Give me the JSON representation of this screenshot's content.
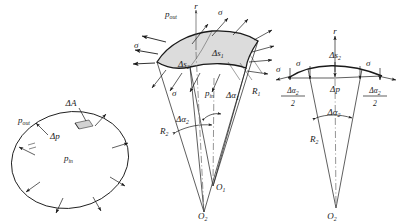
{
  "figure": {
    "background": "#ffffff",
    "ink": "#1a1a1a",
    "patch_fill": "#dcdcdc"
  },
  "fig_left": {
    "name": "closed-surface-pressure",
    "labels": {
      "delta_area": "ΔA",
      "delta_p": "Δp",
      "p_out": "p",
      "p_out_sub": "out",
      "p_in": "p",
      "p_in_sub": "in"
    },
    "arrow_count": 8
  },
  "fig_middle": {
    "name": "shell-element-3d",
    "labels": {
      "radial_axis": "r",
      "p_out": "p",
      "p_out_sub": "out",
      "p_in": "p",
      "p_in_sub": "in",
      "sigma": "σ",
      "delta_s1": "Δs",
      "delta_s1_sub": "1",
      "delta_s2": "Δs",
      "delta_s2_sub": "2",
      "delta_alpha1": "Δα",
      "delta_alpha1_sub": "1",
      "delta_alpha2": "Δα",
      "delta_alpha2_sub": "2",
      "radius_1": "R",
      "radius_1_sub": "1",
      "radius_2": "R",
      "radius_2_sub": "2",
      "center_1": "O",
      "center_1_sub": "1",
      "center_2": "O",
      "center_2_sub": "2"
    },
    "sigma_label_count": 4
  },
  "fig_right": {
    "name": "shell-element-section",
    "labels": {
      "radial_axis": "r",
      "sigma": "σ",
      "delta_s2": "Δs",
      "delta_s2_sub": "2",
      "delta_p": "Δp",
      "half_angle_num": "Δα",
      "half_angle_num_sub": "2",
      "half_angle_den": "2",
      "delta_alpha2": "Δα",
      "delta_alpha2_sub": "2",
      "radius_2": "R",
      "radius_2_sub": "2",
      "center_2": "O",
      "center_2_sub": "2"
    },
    "sigma_label_count": 2
  }
}
